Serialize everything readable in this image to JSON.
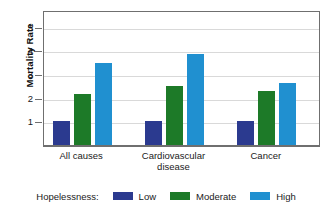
{
  "chart_data": {
    "type": "bar",
    "title": "",
    "xlabel": "",
    "ylabel": "Mortality Rate",
    "categories": [
      "All causes",
      "Cardiovascular disease",
      "Cancer"
    ],
    "category_lines": [
      [
        "All causes"
      ],
      [
        "Cardiovascular",
        "disease"
      ],
      [
        "Cancer"
      ]
    ],
    "series": [
      {
        "name": "Low",
        "color": "#2b3a8f",
        "values": [
          1.0,
          1.0,
          1.0
        ]
      },
      {
        "name": "Moderate",
        "color": "#1d7a28",
        "values": [
          2.15,
          2.5,
          2.3
        ]
      },
      {
        "name": "High",
        "color": "#2090d0",
        "values": [
          3.45,
          3.85,
          2.6
        ]
      }
    ],
    "ylim": [
      0,
      5.7
    ],
    "yticks": [
      1,
      2,
      3,
      4,
      5
    ],
    "ytick_labels": [
      "1",
      "2",
      "3",
      "4",
      "5"
    ],
    "grid": true,
    "legend_position": "bottom",
    "legend_title": "Hopelessness:"
  },
  "legend": {
    "title": "Hopelessness:",
    "items": [
      {
        "label": "Low"
      },
      {
        "label": "Moderate"
      },
      {
        "label": "High"
      }
    ]
  },
  "axis": {
    "y_title": "Mortality Rate",
    "y_labels": [
      "5",
      "4",
      "3",
      "2",
      "1"
    ]
  },
  "categories": [
    {
      "line1": "All causes",
      "line2": ""
    },
    {
      "line1": "Cardiovascular",
      "line2": "disease"
    },
    {
      "line1": "Cancer",
      "line2": ""
    }
  ],
  "colors": {
    "low": "#2b3a8f",
    "moderate": "#1d7a28",
    "high": "#2090d0",
    "grid": "#d9d9d9",
    "frame": "#6f6f6f"
  }
}
